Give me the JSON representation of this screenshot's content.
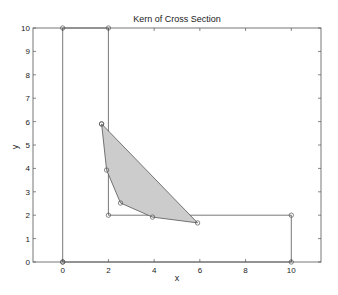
{
  "chart_data": {
    "type": "line",
    "title": "Kern of Cross Section",
    "xlabel": "x",
    "ylabel": "y",
    "xlim": [
      -1.3,
      11.3
    ],
    "ylim": [
      0,
      10
    ],
    "xticks": [
      0,
      2,
      4,
      6,
      8,
      10
    ],
    "yticks": [
      0,
      1,
      2,
      3,
      4,
      5,
      6,
      7,
      8,
      9,
      10
    ],
    "grid": false,
    "legend": null,
    "series": [
      {
        "name": "cross-section outline",
        "style": "line-with-circle-markers",
        "x": [
          0,
          0,
          2,
          2,
          10,
          10,
          0
        ],
        "y": [
          0,
          10,
          10,
          2,
          2,
          0,
          0
        ]
      },
      {
        "name": "kern",
        "style": "filled-polygon-with-circle-markers",
        "fill": "#cccccc",
        "x": [
          1.7,
          1.92,
          2.53,
          3.93,
          5.9,
          1.7
        ],
        "y": [
          5.9,
          3.93,
          2.52,
          1.92,
          1.67,
          5.9
        ]
      }
    ]
  },
  "colors": {
    "axes": "#555555",
    "line": "#555555",
    "fill": "#cccccc",
    "background": "#ffffff"
  }
}
